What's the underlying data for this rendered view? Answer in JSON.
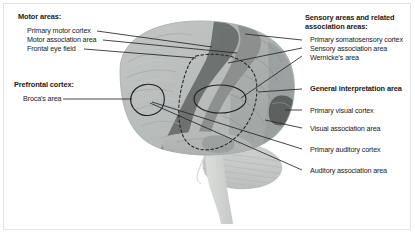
{
  "figure": {
    "background_color": "#ffffff",
    "border_color": "#e3e3e3",
    "text_color": "#1a1a1a",
    "leader_line_color": "#2b2b2b"
  },
  "left_groups": [
    {
      "heading": "Motor areas:",
      "items": [
        "Primary motor cortex",
        "Motor association area",
        "Frontal eye field"
      ]
    },
    {
      "heading": "Prefrontal cortex:",
      "items": [
        "Broca's area"
      ]
    }
  ],
  "right_groups": [
    {
      "heading_line1": "Sensory areas and related",
      "heading_line2": "association areas:",
      "items": [
        "Primary somatosensory cortex",
        "Sensory association area",
        "Wernicke's area"
      ]
    },
    {
      "heading": "General interpretation area",
      "bold_standalone": true,
      "items": []
    },
    {
      "heading": "",
      "items": [
        "Primary visual cortex",
        "Visual association area",
        "Primary auditory cortex",
        "Auditory association area"
      ]
    }
  ],
  "brain_regions": [
    {
      "name": "cerebrum-frontal-lobe",
      "shade": "#b9bcbb"
    },
    {
      "name": "precentral-gyrus-band",
      "shade": "#6e7271"
    },
    {
      "name": "postcentral-gyrus-band",
      "shade": "#8f9392"
    },
    {
      "name": "parietal-lobe",
      "shade": "#a7abaa"
    },
    {
      "name": "occipital-lobe",
      "shade": "#9ea2a1"
    },
    {
      "name": "primary-visual-cortex-patch",
      "shade": "#5e6261"
    },
    {
      "name": "temporal-lobe",
      "shade": "#b3b7b6"
    },
    {
      "name": "cerebellum",
      "shade": "#c9ccca"
    },
    {
      "name": "brainstem",
      "shade": "#d2d5d3"
    },
    {
      "name": "general-interpretation-area-dashed-oval",
      "shade": "dashed-outline"
    },
    {
      "name": "wernickes-area-ellipse",
      "shade": "solid-outline"
    },
    {
      "name": "brocas-area-outline",
      "shade": "solid-outline"
    }
  ]
}
